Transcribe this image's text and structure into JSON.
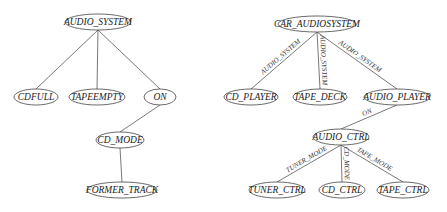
{
  "left_tree": {
    "nodes": [
      {
        "id": "audio_system",
        "label": "AUDIO_SYSTEM",
        "x": 98,
        "y": 22,
        "rx": 33
      },
      {
        "id": "cdfull",
        "label": "CDFULL",
        "x": 36,
        "y": 97,
        "rx": 22
      },
      {
        "id": "tapeempty",
        "label": "TAPEEMPTY",
        "x": 97,
        "y": 97,
        "rx": 28
      },
      {
        "id": "on",
        "label": "ON",
        "x": 160,
        "y": 97,
        "rx": 16
      },
      {
        "id": "cd_mode",
        "label": "CD_MODE",
        "x": 120,
        "y": 140,
        "rx": 24
      },
      {
        "id": "former_track",
        "label": "FORMER_TRACK",
        "x": 122,
        "y": 190,
        "rx": 35
      }
    ],
    "edges": [
      {
        "from": "audio_system",
        "to": "cdfull",
        "label": ""
      },
      {
        "from": "audio_system",
        "to": "tapeempty",
        "label": ""
      },
      {
        "from": "audio_system",
        "to": "on",
        "label": ""
      },
      {
        "from": "on",
        "to": "cd_mode",
        "label": ""
      },
      {
        "from": "cd_mode",
        "to": "former_track",
        "label": ""
      }
    ]
  },
  "right_tree": {
    "nodes": [
      {
        "id": "car_audiosystem",
        "label": "CAR_AUDIOSYSTEM",
        "x": 317,
        "y": 24,
        "rx": 39
      },
      {
        "id": "cd_player",
        "label": "CD_PLAYER",
        "x": 251,
        "y": 97,
        "rx": 27
      },
      {
        "id": "tape_deck",
        "label": "TAPE_DECK",
        "x": 320,
        "y": 97,
        "rx": 27
      },
      {
        "id": "audio_player",
        "label": "AUDIO_PLAYER",
        "x": 397,
        "y": 97,
        "rx": 33
      },
      {
        "id": "audio_ctrl",
        "label": "AUDIO_CTRL",
        "x": 341,
        "y": 137,
        "rx": 28
      },
      {
        "id": "tuner_ctrl",
        "label": "TUNER_CTRL",
        "x": 277,
        "y": 190,
        "rx": 28
      },
      {
        "id": "cd_ctrl",
        "label": "CD_CTRL",
        "x": 342,
        "y": 190,
        "rx": 23
      },
      {
        "id": "tape_ctrl",
        "label": "TAPE_CTRL",
        "x": 403,
        "y": 190,
        "rx": 26
      }
    ],
    "edges": [
      {
        "from": "car_audiosystem",
        "to": "cd_player",
        "label": "AUDIO_SYSTEM"
      },
      {
        "from": "car_audiosystem",
        "to": "tape_deck",
        "label": "AUDIO_SYSTEM"
      },
      {
        "from": "car_audiosystem",
        "to": "audio_player",
        "label": "AUDIO_SYSTEM"
      },
      {
        "from": "audio_player",
        "to": "audio_ctrl",
        "label": "ON"
      },
      {
        "from": "audio_ctrl",
        "to": "tuner_ctrl",
        "label": "TUNER_MODE"
      },
      {
        "from": "audio_ctrl",
        "to": "cd_ctrl",
        "label": "CD_MODE"
      },
      {
        "from": "audio_ctrl",
        "to": "tape_ctrl",
        "label": "TAPE_MODE"
      }
    ]
  }
}
